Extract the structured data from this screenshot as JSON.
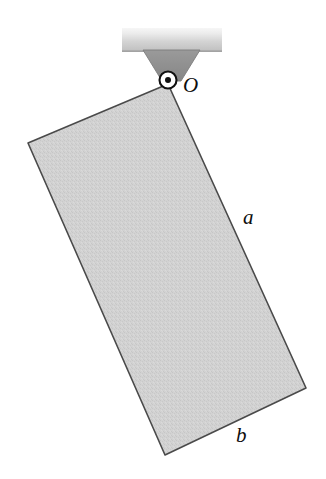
{
  "figure": {
    "background_color": "#ffffff"
  },
  "ceiling": {
    "name": "ceiling-support-bar",
    "fill_light": "#f2f2f2",
    "fill_mid": "#c9c9c9",
    "fill_edge": "#b4b4b4",
    "x": 122,
    "y": 28,
    "width": 100,
    "height": 24
  },
  "bracket": {
    "name": "pivot-bracket",
    "fill": "#8f8f8f",
    "stroke": "#6e6e6e",
    "points": "143,50 200,50 180,80 163,80"
  },
  "pivot": {
    "label": "O",
    "cx": 168,
    "cy": 80,
    "outer_radius": 8.5,
    "inner_radius": 3.0,
    "outer_fill": "#ffffff",
    "outer_stroke": "#111111",
    "inner_fill": "#111111",
    "label_x": 183,
    "label_y": 92,
    "label_font_size": 21
  },
  "plate": {
    "name": "rectangular-plate",
    "fill": "#cfcfcf",
    "stroke": "#4a4a4a",
    "stroke_width": 1.6,
    "points": "168,84 28,143 165,455 306,388",
    "vertices": {
      "top_right_pivot": [
        168,
        84
      ],
      "top_left": [
        28,
        143
      ],
      "bottom_left": [
        165,
        455
      ],
      "bottom_right": [
        306,
        388
      ]
    }
  },
  "labels": {
    "side_a": {
      "text": "a",
      "x": 243,
      "y": 224,
      "font_size": 21,
      "describes": "long side of plate from pivot to bottom-right corner"
    },
    "side_b": {
      "text": "b",
      "x": 236,
      "y": 442,
      "font_size": 21,
      "describes": "short side of plate along the bottom edge"
    }
  },
  "colors": {
    "plate_gray": "#cfcfcf",
    "bracket_gray": "#8f8f8f",
    "outline_dark": "#4a4a4a",
    "ink_black": "#111111",
    "paper_white": "#ffffff"
  }
}
